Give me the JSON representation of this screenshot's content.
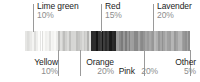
{
  "chart_data": {
    "type": "bar",
    "orientation": "horizontal-stacked",
    "title": "",
    "xlabel": "",
    "ylabel": "",
    "grid": false,
    "legend_position": "callouts",
    "categories": [
      "Yellow",
      "Lime green",
      "Orange",
      "Red",
      "Pink",
      "Lavender",
      "Other"
    ],
    "values": [
      10,
      10,
      20,
      15,
      20,
      20,
      5
    ],
    "value_unit": "%",
    "series": [
      {
        "name": "Color share",
        "values": [
          10,
          10,
          20,
          15,
          20,
          20,
          5
        ]
      }
    ],
    "segments": [
      {
        "label": "Yellow",
        "value": 10,
        "value_text": "10%",
        "shade": "#f2f2f0",
        "callout": "bottom"
      },
      {
        "label": "Lime green",
        "value": 10,
        "value_text": "10%",
        "shade": "#e4e4e2",
        "callout": "top"
      },
      {
        "label": "Orange",
        "value": 20,
        "value_text": "20%",
        "shade": "#c8c8c6",
        "callout": "bottom"
      },
      {
        "label": "Red",
        "value": 15,
        "value_text": "15%",
        "shade": "#2b2b2b",
        "callout": "top"
      },
      {
        "label": "Pink",
        "value": 20,
        "value_text": "20%",
        "shade": "#8f8f8f",
        "callout": "bottom"
      },
      {
        "label": "Lavender",
        "value": 20,
        "value_text": "20%",
        "shade": "#a6a6a6",
        "callout": "top"
      },
      {
        "label": "Other",
        "value": 5,
        "value_text": "5%",
        "shade": "#9d9d9d",
        "callout": "bottom"
      }
    ],
    "colors": {
      "label_text": "#1c1c1c",
      "value_text": "#8d8d8d",
      "leader_line": "#9a9a9a",
      "background": "#ffffff"
    }
  },
  "callouts": {
    "lime_green": {
      "name": "Lime green",
      "pct": "10%"
    },
    "red": {
      "name": "Red",
      "pct": "15%"
    },
    "lavender": {
      "name": "Lavender",
      "pct": "20%"
    },
    "yellow": {
      "name": "Yellow",
      "pct": "10%"
    },
    "orange": {
      "name": "Orange",
      "pct": "20%"
    },
    "pink": {
      "name": "Pink",
      "pct": "20%"
    },
    "other": {
      "name": "Other",
      "pct": "5%"
    }
  }
}
